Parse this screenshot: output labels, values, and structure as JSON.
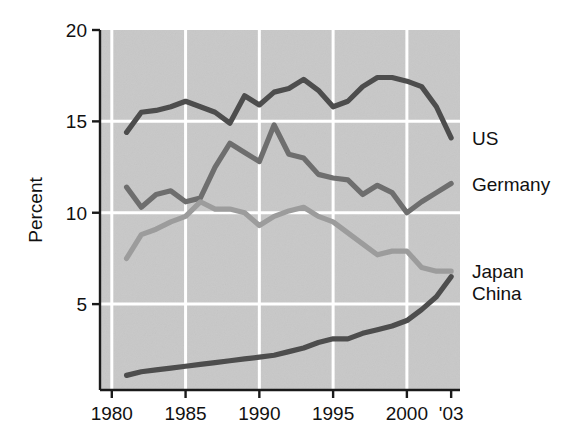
{
  "chart_data": {
    "type": "line",
    "title": "",
    "subtitle": "",
    "xlabel": "",
    "ylabel": "Percent",
    "xlim": [
      1979.2,
      2003.6
    ],
    "ylim": [
      0.3,
      20
    ],
    "grid": true,
    "grid_color": "#ffffff",
    "plot_background": "#c8c8c8",
    "legend_position": "right-inline-labels",
    "x_tick_labels": [
      "1980",
      "1985",
      "1990",
      "1995",
      "2000",
      "'03"
    ],
    "x_tick_values": [
      1980,
      1985,
      1990,
      1995,
      2000,
      2003
    ],
    "y_tick_labels": [
      "20",
      "15",
      "10",
      "5"
    ],
    "y_tick_values": [
      20,
      15,
      10,
      5
    ],
    "x": [
      1981,
      1982,
      1983,
      1984,
      1985,
      1986,
      1987,
      1988,
      1989,
      1990,
      1991,
      1992,
      1993,
      1994,
      1995,
      1996,
      1997,
      1998,
      1999,
      2000,
      2001,
      2002,
      2003
    ],
    "series": [
      {
        "name": "US",
        "color": "#4d4d4d",
        "label_y_value": 14.1,
        "values": [
          14.4,
          15.5,
          15.6,
          15.8,
          16.1,
          15.8,
          15.5,
          14.9,
          16.4,
          15.9,
          16.6,
          16.8,
          17.3,
          16.7,
          15.8,
          16.1,
          16.9,
          17.4,
          17.4,
          17.2,
          16.9,
          15.8,
          14.1
        ]
      },
      {
        "name": "Germany",
        "color": "#6e6e6e",
        "label_y_value": 11.6,
        "values": [
          11.4,
          10.3,
          11.0,
          11.2,
          10.6,
          10.8,
          12.5,
          13.8,
          13.3,
          12.8,
          14.8,
          13.2,
          13.0,
          12.1,
          11.9,
          11.8,
          11.0,
          11.5,
          11.1,
          10.0,
          10.6,
          11.1,
          11.6
        ]
      },
      {
        "name": "Japan",
        "color": "#9c9c9c",
        "label_y_value": 6.8,
        "values": [
          7.5,
          8.8,
          9.1,
          9.5,
          9.8,
          10.6,
          10.2,
          10.2,
          10.0,
          9.3,
          9.8,
          10.1,
          10.3,
          9.8,
          9.5,
          8.9,
          8.3,
          7.7,
          7.9,
          7.9,
          7.0,
          6.8,
          6.8
        ]
      },
      {
        "name": "China",
        "color": "#4d4d4d",
        "label_y_value": 5.6,
        "values": [
          1.1,
          1.3,
          1.4,
          1.5,
          1.6,
          1.7,
          1.8,
          1.9,
          2.0,
          2.1,
          2.2,
          2.4,
          2.6,
          2.9,
          3.1,
          3.1,
          3.4,
          3.6,
          3.8,
          4.1,
          4.7,
          5.4,
          6.5
        ]
      }
    ]
  },
  "axis": {
    "y_title": "Percent"
  },
  "series_labels": [
    {
      "text": "US"
    },
    {
      "text": "Germany"
    },
    {
      "text": "Japan"
    },
    {
      "text": "China"
    }
  ]
}
